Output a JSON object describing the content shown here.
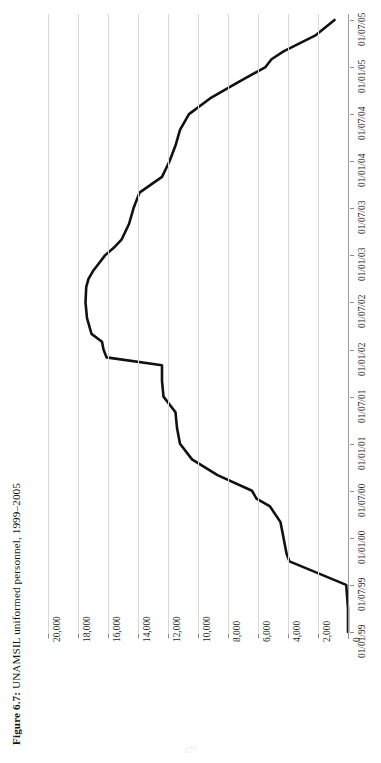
{
  "caption": {
    "lead": "Figure 6.7:",
    "rest": " UNAMSIL uniformed personnel, 1999–2005"
  },
  "page_number": "177",
  "chart_data": {
    "type": "line",
    "title": "Figure 6.7: UNAMSIL uniformed personnel, 1999–2005",
    "xlabel": "",
    "ylabel": "",
    "orientation": "rotated-90",
    "grid": true,
    "legend": "none",
    "line_color": "#111111",
    "xlim": [
      "01/01/99",
      "01/07/05"
    ],
    "ylim": [
      0,
      21000
    ],
    "ytick_labels": [
      "20,000",
      "18,000",
      "16,000",
      "14,000",
      "12,000",
      "10,000",
      "8,000",
      "6,000",
      "4,000",
      "2,000",
      "0"
    ],
    "ytick_values": [
      20000,
      18000,
      16000,
      14000,
      12000,
      10000,
      8000,
      6000,
      4000,
      2000,
      0
    ],
    "xtick_labels": [
      "01/01/99",
      "01/07/99",
      "01/01/00",
      "01/07/00",
      "01/01/01",
      "01/07/01",
      "01/01/02",
      "01/07/02",
      "01/01/03",
      "01/07/03",
      "01/01/04",
      "01/07/04",
      "01/01/05",
      "01/07/05"
    ],
    "x": [
      "01/01/99",
      "01/04/99",
      "01/07/99",
      "01/10/99",
      "01/11/99",
      "01/01/00",
      "01/03/00",
      "01/05/00",
      "01/06/00",
      "01/07/00",
      "01/09/00",
      "01/11/00",
      "01/01/01",
      "01/03/01",
      "01/05/01",
      "01/07/01",
      "01/09/01",
      "01/11/01",
      "01/12/01",
      "01/01/02",
      "01/02/02",
      "01/03/02",
      "01/05/02",
      "01/07/02",
      "01/09/02",
      "01/10/02",
      "01/11/02",
      "01/12/02",
      "01/01/03",
      "01/02/03",
      "01/03/03",
      "01/05/03",
      "01/07/03",
      "01/09/03",
      "01/11/03",
      "01/01/04",
      "01/03/04",
      "01/05/04",
      "01/07/04",
      "01/09/04",
      "01/11/04",
      "01/01/05",
      "01/02/05",
      "01/03/05",
      "01/05/05",
      "01/07/05"
    ],
    "y": [
      0,
      0,
      120,
      3900,
      4100,
      4300,
      4500,
      5200,
      6100,
      6400,
      8700,
      10400,
      11200,
      11400,
      11500,
      12300,
      12400,
      12400,
      16100,
      16300,
      16400,
      17100,
      17400,
      17500,
      17450,
      17300,
      17000,
      16600,
      16200,
      15600,
      15100,
      14600,
      14300,
      13900,
      12400,
      11900,
      11500,
      11200,
      10600,
      9200,
      7400,
      5500,
      5100,
      4300,
      2200,
      900
    ],
    "series": [
      {
        "name": "UNAMSIL uniformed personnel",
        "values": [
          0,
          0,
          120,
          3900,
          4100,
          4300,
          4500,
          5200,
          6100,
          6400,
          8700,
          10400,
          11200,
          11400,
          11500,
          12300,
          12400,
          12400,
          16100,
          16300,
          16400,
          17100,
          17400,
          17500,
          17450,
          17300,
          17000,
          16600,
          16200,
          15600,
          15100,
          14600,
          14300,
          13900,
          12400,
          11900,
          11500,
          11200,
          10600,
          9200,
          7400,
          5500,
          5100,
          4300,
          2200,
          900
        ]
      }
    ],
    "notes": {
      "peak_value": 17500,
      "peak_date": "01/07/02",
      "start_value": 0,
      "end_value": 900
    }
  }
}
